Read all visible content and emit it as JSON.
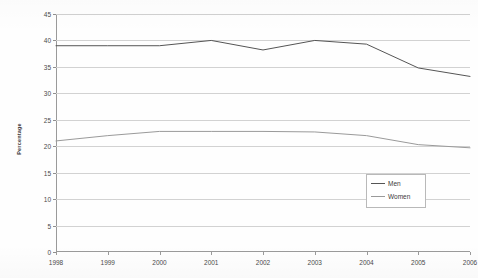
{
  "chart_data": {
    "type": "line",
    "title": "",
    "xlabel": "",
    "ylabel": "Percentage",
    "categories": [
      "1998",
      "1999",
      "2000",
      "2001",
      "2002",
      "2003",
      "2004",
      "2005",
      "2006"
    ],
    "x": [
      1998,
      1999,
      2000,
      2001,
      2002,
      2003,
      2004,
      2005,
      2006
    ],
    "ylim": [
      0,
      45
    ],
    "ytick_step": 5,
    "yticks": [
      "0",
      "5",
      "10",
      "15",
      "20",
      "25",
      "30",
      "35",
      "40",
      "45"
    ],
    "grid": true,
    "legend_position": "bottom-right",
    "series": [
      {
        "name": "Men",
        "color": "#555555",
        "values": [
          39.0,
          39.0,
          39.0,
          40.0,
          38.2,
          40.0,
          39.3,
          34.8,
          33.2
        ]
      },
      {
        "name": "Women",
        "color": "#9a9a9a",
        "values": [
          21.0,
          22.0,
          22.8,
          22.8,
          22.8,
          22.7,
          22.0,
          20.3,
          19.7
        ]
      }
    ]
  },
  "legend": {
    "entries": [
      {
        "label": "Men"
      },
      {
        "label": "Women"
      }
    ]
  },
  "colors": {
    "men": "#555555",
    "women": "#9a9a9a",
    "grid": "#d2d2d2",
    "axis": "#9a9a9a",
    "text": "#4a4a4a",
    "background": "#fefefe"
  }
}
